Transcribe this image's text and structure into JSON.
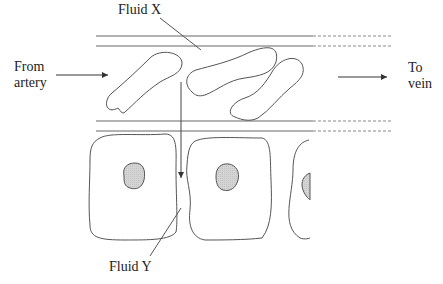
{
  "labels": {
    "fluid_x": "Fluid X",
    "fluid_y": "Fluid Y",
    "from_artery": "From\nartery",
    "to_vein": "To\nvein"
  },
  "colors": {
    "stroke": "#555555",
    "nucleus_fill": "#d4d4d4",
    "text": "#222222"
  },
  "structure": {
    "capillary": "blood vessel with wall lines continuing as dashed lines",
    "blood_cells": 3,
    "tissue_cells": 3,
    "flow_arrow": "from capillary down between tissue cells"
  }
}
